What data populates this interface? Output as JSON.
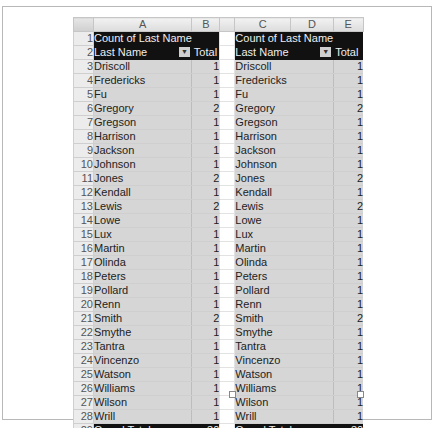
{
  "columns": [
    "A",
    "B",
    "C",
    "D",
    "E"
  ],
  "pivot_left": {
    "title": "Count of Last Name",
    "row_label_header": "Last Name",
    "value_header": "Total",
    "filter_icon": "dropdown-arrow-icon",
    "rows": [
      {
        "name": "Driscoll",
        "count": "1"
      },
      {
        "name": "Fredericks",
        "count": "1"
      },
      {
        "name": "Fu",
        "count": "1"
      },
      {
        "name": "Gregory",
        "count": "2"
      },
      {
        "name": "Gregson",
        "count": "1"
      },
      {
        "name": "Harrison",
        "count": "1"
      },
      {
        "name": "Jackson",
        "count": "1"
      },
      {
        "name": "Johnson",
        "count": "1"
      },
      {
        "name": "Jones",
        "count": "2"
      },
      {
        "name": "Kendall",
        "count": "1"
      },
      {
        "name": "Lewis",
        "count": "2"
      },
      {
        "name": "Lowe",
        "count": "1"
      },
      {
        "name": "Lux",
        "count": "1"
      },
      {
        "name": "Martin",
        "count": "1"
      },
      {
        "name": "Olinda",
        "count": "1"
      },
      {
        "name": "Peters",
        "count": "1"
      },
      {
        "name": "Pollard",
        "count": "1"
      },
      {
        "name": "Renn",
        "count": "1"
      },
      {
        "name": "Smith",
        "count": "2"
      },
      {
        "name": "Smythe",
        "count": "1"
      },
      {
        "name": "Tantra",
        "count": "1"
      },
      {
        "name": "Vincenzo",
        "count": "1"
      },
      {
        "name": "Watson",
        "count": "1"
      },
      {
        "name": "Williams",
        "count": "1"
      },
      {
        "name": "Wilson",
        "count": "1"
      },
      {
        "name": "Wrill",
        "count": "1"
      }
    ],
    "grand_total_label": "Grand Total",
    "grand_total": "30"
  },
  "pivot_right": {
    "title": "Count of Last Name",
    "row_label_header": "Last Name",
    "value_header": "Total",
    "filter_icon": "dropdown-arrow-icon",
    "rows": [
      {
        "name": "Driscoll",
        "count": "1"
      },
      {
        "name": "Fredericks",
        "count": "1"
      },
      {
        "name": "Fu",
        "count": "1"
      },
      {
        "name": "Gregory",
        "count": "2"
      },
      {
        "name": "Gregson",
        "count": "1"
      },
      {
        "name": "Harrison",
        "count": "1"
      },
      {
        "name": "Jackson",
        "count": "1"
      },
      {
        "name": "Johnson",
        "count": "1"
      },
      {
        "name": "Jones",
        "count": "2"
      },
      {
        "name": "Kendall",
        "count": "1"
      },
      {
        "name": "Lewis",
        "count": "2"
      },
      {
        "name": "Lowe",
        "count": "1"
      },
      {
        "name": "Lux",
        "count": "1"
      },
      {
        "name": "Martin",
        "count": "1"
      },
      {
        "name": "Olinda",
        "count": "1"
      },
      {
        "name": "Peters",
        "count": "1"
      },
      {
        "name": "Pollard",
        "count": "1"
      },
      {
        "name": "Renn",
        "count": "1"
      },
      {
        "name": "Smith",
        "count": "2"
      },
      {
        "name": "Smythe",
        "count": "1"
      },
      {
        "name": "Tantra",
        "count": "1"
      },
      {
        "name": "Vincenzo",
        "count": "1"
      },
      {
        "name": "Watson",
        "count": "1"
      },
      {
        "name": "Williams",
        "count": "1"
      },
      {
        "name": "Wilson",
        "count": "1"
      },
      {
        "name": "Wrill",
        "count": "1"
      }
    ],
    "grand_total_label": "Grand Total",
    "grand_total": "30"
  },
  "row_numbers": [
    "1",
    "2",
    "3",
    "4",
    "5",
    "6",
    "7",
    "8",
    "9",
    "10",
    "11",
    "12",
    "13",
    "14",
    "15",
    "16",
    "17",
    "18",
    "19",
    "20",
    "21",
    "22",
    "23",
    "24",
    "25",
    "26",
    "27",
    "28",
    "29"
  ]
}
